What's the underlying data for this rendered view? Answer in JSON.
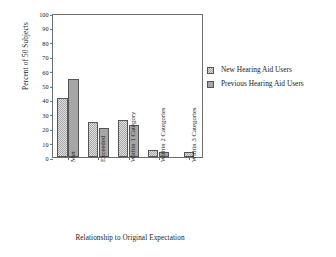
{
  "chart_data": {
    "type": "bar",
    "title": "",
    "xlabel": "Relationship to Original Expectation",
    "ylabel": "Percent of 50 Subjects",
    "categories": [
      "Met",
      "Exceeded",
      "Within 1 Category",
      "Within 2 Categories",
      "Within 3 Categories"
    ],
    "series": [
      {
        "name": "New Hearing Aid Users",
        "values": [
          41,
          24,
          26,
          5,
          3.5
        ],
        "color": "#dedede",
        "pattern": "checker"
      },
      {
        "name": "Previous Hearing Aid Users",
        "values": [
          54,
          20,
          22,
          3.5,
          0
        ],
        "color": "#a6a6a6",
        "pattern": "solid"
      }
    ],
    "ylim": [
      0,
      100
    ],
    "yticks": [
      0,
      10,
      20,
      30,
      40,
      50,
      60,
      70,
      80,
      90,
      100
    ],
    "ytick_labels": [
      "0",
      "10",
      "20",
      "30",
      "40",
      "50",
      "60",
      "70",
      "80",
      "90",
      "100"
    ],
    "grid": false,
    "legend_position": "right",
    "legend_entries": [
      "New Hearing Aid Users",
      "Previous Hearing Aid Users"
    ]
  }
}
